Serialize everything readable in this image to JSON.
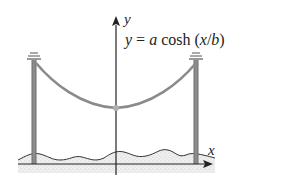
{
  "diagram": {
    "equation": {
      "lhs": "y",
      "eq": " = ",
      "a": "a",
      "func": " cosh (",
      "x": "x",
      "slash": "/",
      "b": "b",
      "close": ")"
    },
    "axes": {
      "x_label": "x",
      "y_label": "y"
    },
    "colors": {
      "cable": "#8a8a8a",
      "pole": "#6e6e6e",
      "axis": "#222222",
      "ground_fill": "#e6e6e6",
      "vertex": "#b0b0b0"
    }
  }
}
